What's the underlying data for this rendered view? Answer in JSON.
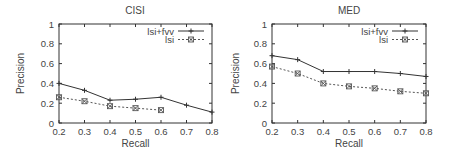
{
  "chart_data": [
    {
      "type": "line",
      "title": "CISI",
      "xlabel": "Recall",
      "ylabel": "Precision",
      "xlim": [
        0.2,
        0.8
      ],
      "ylim": [
        0,
        1
      ],
      "xticks": [
        "0.2",
        "0.3",
        "0.4",
        "0.5",
        "0.6",
        "0.7",
        "0.8"
      ],
      "yticks": [
        "0",
        "0.2",
        "0.4",
        "0.6",
        "0.8",
        "1"
      ],
      "grid": false,
      "legend_position": "top-right",
      "series": [
        {
          "name": "lsi+fvv",
          "style": "solid",
          "marker": "plus",
          "x": [
            0.2,
            0.3,
            0.4,
            0.5,
            0.6,
            0.7,
            0.8
          ],
          "values": [
            0.4,
            0.33,
            0.23,
            0.24,
            0.26,
            0.18,
            0.11
          ]
        },
        {
          "name": "lsi",
          "style": "dotted",
          "marker": "boxed-x",
          "x": [
            0.2,
            0.3,
            0.4,
            0.5,
            0.6
          ],
          "values": [
            0.26,
            0.22,
            0.17,
            0.15,
            0.13
          ]
        }
      ]
    },
    {
      "type": "line",
      "title": "MED",
      "xlabel": "Recall",
      "ylabel": "Precision",
      "xlim": [
        0.2,
        0.8
      ],
      "ylim": [
        0,
        1
      ],
      "xticks": [
        "0.2",
        "0.3",
        "0.4",
        "0.5",
        "0.6",
        "0.7",
        "0.8"
      ],
      "yticks": [
        "0",
        "0.2",
        "0.4",
        "0.6",
        "0.8",
        "1"
      ],
      "grid": false,
      "legend_position": "top-right",
      "series": [
        {
          "name": "lsi+fvv",
          "style": "solid",
          "marker": "plus",
          "x": [
            0.2,
            0.3,
            0.4,
            0.5,
            0.6,
            0.7,
            0.8
          ],
          "values": [
            0.68,
            0.64,
            0.52,
            0.52,
            0.52,
            0.5,
            0.47
          ]
        },
        {
          "name": "lsi",
          "style": "dotted",
          "marker": "boxed-x",
          "x": [
            0.2,
            0.3,
            0.4,
            0.5,
            0.6,
            0.7,
            0.8
          ],
          "values": [
            0.57,
            0.5,
            0.4,
            0.37,
            0.35,
            0.32,
            0.3
          ]
        }
      ]
    }
  ],
  "colors": {
    "axis": "#333333",
    "text": "#444444",
    "series_solid": "#333333",
    "series_dotted": "#555555"
  }
}
